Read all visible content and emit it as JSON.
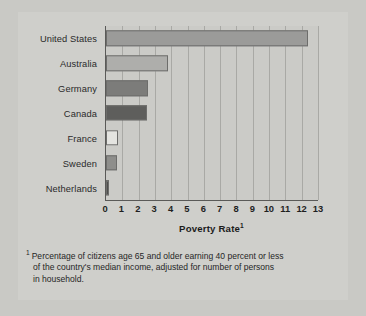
{
  "chart_data": {
    "type": "bar",
    "orientation": "horizontal",
    "title": "",
    "xlabel": "Poverty Rate",
    "xlabel_footnote_marker": "1",
    "ylabel": "",
    "categories": [
      "United States",
      "Australia",
      "Germany",
      "Canada",
      "France",
      "Sweden",
      "Netherlands"
    ],
    "values": [
      12.4,
      3.8,
      2.6,
      2.5,
      0.75,
      0.7,
      0.2
    ],
    "xlim": [
      0,
      13
    ],
    "xticks": [
      "0",
      "1",
      "2",
      "3",
      "4",
      "5",
      "6",
      "7",
      "8",
      "9",
      "10",
      "11",
      "12",
      "13"
    ],
    "grid": true,
    "grid_axis": "x",
    "legend": "none",
    "bar_colors": [
      "#9b9b99",
      "#aeaeab",
      "#7c7c7a",
      "#5e5e5c",
      "#e4e4e0",
      "#8e8e8b",
      "#4f4f4d"
    ]
  },
  "footnote": {
    "marker": "1",
    "line1": "Percentage of citizens age 65 and older earning 40 percent or less",
    "line2": "of the country's median income, adjusted for number of persons",
    "line3": "in household."
  },
  "colors": {
    "page_background": "#c9c9c5",
    "card_background": "#cfcfcb",
    "plot_background": "#cbcbc7",
    "axis_line": "#5a5a58",
    "gridline": "#a9a9a5",
    "text": "#262626"
  }
}
